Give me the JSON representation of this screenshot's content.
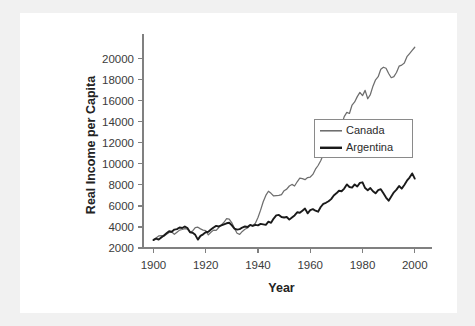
{
  "chart_data": {
    "type": "line",
    "title": "",
    "xlabel": "Year",
    "ylabel": "Real Income per Capita",
    "xlim": [
      1896,
      2002
    ],
    "ylim": [
      2000,
      21600
    ],
    "grid": false,
    "legend_position": "center-right",
    "xticks": [
      1900,
      1920,
      1940,
      1960,
      1980,
      2000
    ],
    "xtick_labels": [
      "1900",
      "1920",
      "1940",
      "1960",
      "1980",
      "2000"
    ],
    "yticks": [
      2000,
      4000,
      6000,
      8000,
      10000,
      12000,
      14000,
      16000,
      18000,
      20000
    ],
    "ytick_labels": [
      "2000",
      "4000",
      "6000",
      "8000",
      "10000",
      "12000",
      "14000",
      "16000",
      "18000",
      "20000"
    ],
    "x": [
      1900,
      1901,
      1902,
      1903,
      1904,
      1905,
      1906,
      1907,
      1908,
      1909,
      1910,
      1911,
      1912,
      1913,
      1914,
      1915,
      1916,
      1917,
      1918,
      1919,
      1920,
      1921,
      1922,
      1923,
      1924,
      1925,
      1926,
      1927,
      1928,
      1929,
      1930,
      1931,
      1932,
      1933,
      1934,
      1935,
      1936,
      1937,
      1938,
      1939,
      1940,
      1941,
      1942,
      1943,
      1944,
      1945,
      1946,
      1947,
      1948,
      1949,
      1950,
      1951,
      1952,
      1953,
      1954,
      1955,
      1956,
      1957,
      1958,
      1959,
      1960,
      1961,
      1962,
      1963,
      1964,
      1965,
      1966,
      1967,
      1968,
      1969,
      1970,
      1971,
      1972,
      1973,
      1974,
      1975,
      1976,
      1977,
      1978,
      1979,
      1980,
      1981,
      1982,
      1983,
      1984,
      1985,
      1986,
      1987,
      1988,
      1989,
      1990,
      1991,
      1992,
      1993,
      1994,
      1995,
      1996,
      1997,
      1998,
      1999,
      2000
    ],
    "series": [
      {
        "name": "Canada",
        "color": "#6e6e6e",
        "values": [
          2800,
          2950,
          3150,
          3180,
          3120,
          3300,
          3480,
          3520,
          3300,
          3500,
          3700,
          3760,
          3850,
          3800,
          3520,
          3620,
          3950,
          3980,
          3820,
          3700,
          3650,
          3250,
          3500,
          3700,
          3680,
          3950,
          4200,
          4450,
          4800,
          4750,
          4400,
          3850,
          3400,
          3300,
          3580,
          3780,
          3900,
          4150,
          4120,
          4350,
          4900,
          5600,
          6400,
          7000,
          7400,
          7200,
          6950,
          6980,
          7000,
          7080,
          7450,
          7600,
          7900,
          8050,
          7900,
          8300,
          8650,
          8600,
          8500,
          8700,
          8750,
          9000,
          9500,
          9850,
          10300,
          10900,
          11400,
          11600,
          12000,
          12500,
          12600,
          13100,
          13700,
          14500,
          14900,
          14800,
          15600,
          15900,
          16400,
          16800,
          16500,
          17000,
          16200,
          16600,
          17400,
          18000,
          18300,
          19000,
          19200,
          19100,
          18600,
          18200,
          18300,
          18700,
          19300,
          19400,
          19600,
          20200,
          20500,
          20800,
          21100
        ]
      },
      {
        "name": "Argentina",
        "color": "#1a1a1a",
        "values": [
          2750,
          2900,
          2800,
          3000,
          3200,
          3400,
          3600,
          3550,
          3750,
          3800,
          3950,
          3900,
          4050,
          3900,
          3500,
          3450,
          3250,
          2800,
          3150,
          3300,
          3500,
          3550,
          3750,
          3950,
          4100,
          4050,
          4150,
          4250,
          4350,
          4400,
          4150,
          3850,
          3750,
          3800,
          3950,
          4050,
          4000,
          4200,
          4100,
          4200,
          4150,
          4300,
          4250,
          4200,
          4500,
          4400,
          4800,
          5100,
          5150,
          4950,
          4900,
          4950,
          4700,
          4900,
          5100,
          5400,
          5350,
          5550,
          5750,
          5300,
          5600,
          5700,
          5550,
          5450,
          5900,
          6200,
          6300,
          6450,
          6650,
          7000,
          7200,
          7450,
          7400,
          7650,
          8050,
          7800,
          7750,
          8050,
          7850,
          8200,
          8250,
          7700,
          7500,
          7700,
          7400,
          7200,
          7500,
          7600,
          7200,
          6800,
          6500,
          6900,
          7300,
          7550,
          7900,
          7650,
          8000,
          8400,
          8700,
          9100,
          8600
        ]
      }
    ]
  },
  "legend": {
    "entries": [
      {
        "label": "Canada",
        "icon": "line-swatch-icon"
      },
      {
        "label": "Argentina",
        "icon": "line-swatch-icon"
      }
    ]
  }
}
